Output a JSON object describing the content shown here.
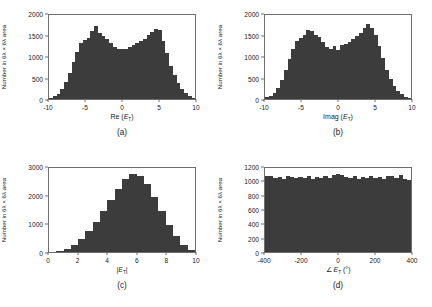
{
  "figure": {
    "bar_color": "#3c3c3c",
    "axis_color": "#6e6e6e",
    "background": "#ffffff"
  },
  "panels": [
    {
      "caption": "(a)",
      "ylabel": "Number in 6λ × 6λ area",
      "xlabel_html": "Re (<i>E</i><sub>T</sub>)",
      "xlabel": "Re (E_T)",
      "yticks": [
        "0",
        "500",
        "1000",
        "1500",
        "2000"
      ],
      "xticks": [
        "-10",
        "-5",
        "0",
        "5",
        "10"
      ]
    },
    {
      "caption": "(b)",
      "ylabel": "Number in 6λ × 6λ area",
      "xlabel_html": "Imag (<i>E</i><sub>T</sub>)",
      "xlabel": "Imag (E_T)",
      "yticks": [
        "0",
        "500",
        "1000",
        "1500",
        "2000"
      ],
      "xticks": [
        "-10",
        "-5",
        "0",
        "5",
        "10"
      ]
    },
    {
      "caption": "(c)",
      "ylabel": "Number in 6λ × 6λ area",
      "xlabel_html": "|<i>E</i><sub>T</sub>|",
      "xlabel": "|E_T|",
      "yticks": [
        "0",
        "1000",
        "2000",
        "3000"
      ],
      "xticks": [
        "0",
        "2",
        "4",
        "6",
        "8",
        "10"
      ]
    },
    {
      "caption": "(d)",
      "ylabel": "Number in 6λ × 6λ area",
      "xlabel_html": "∠ <i>E</i><sub>T</sub> (°)",
      "xlabel": "∠E_T (°)",
      "yticks": [
        "0",
        "200",
        "400",
        "600",
        "800",
        "1000",
        "1200"
      ],
      "xticks": [
        "-400",
        "-200",
        "0",
        "200",
        "400"
      ]
    }
  ],
  "chart_data": [
    {
      "type": "bar",
      "title": "",
      "subplot": "(a)",
      "xlabel": "Re (E_T)",
      "ylabel": "Number in 6λ × 6λ area",
      "xlim": [
        -10,
        10
      ],
      "ylim": [
        0,
        2000
      ],
      "grid": false,
      "bin_centers": [
        -9.5,
        -9.0,
        -8.5,
        -8.0,
        -7.5,
        -7.0,
        -6.5,
        -6.0,
        -5.5,
        -5.0,
        -4.5,
        -4.0,
        -3.5,
        -3.0,
        -2.5,
        -2.0,
        -1.5,
        -1.0,
        -0.5,
        0.0,
        0.5,
        1.0,
        1.5,
        2.0,
        2.5,
        3.0,
        3.5,
        4.0,
        4.5,
        5.0,
        5.5,
        6.0,
        6.5,
        7.0,
        7.5,
        8.0,
        8.5,
        9.0,
        9.5
      ],
      "values": [
        30,
        60,
        120,
        230,
        400,
        620,
        870,
        1130,
        1330,
        1400,
        1450,
        1620,
        1750,
        1580,
        1490,
        1420,
        1330,
        1250,
        1200,
        1180,
        1200,
        1230,
        1280,
        1330,
        1380,
        1420,
        1520,
        1600,
        1670,
        1640,
        1380,
        1100,
        790,
        560,
        390,
        250,
        140,
        70,
        30
      ]
    },
    {
      "type": "bar",
      "title": "",
      "subplot": "(b)",
      "xlabel": "Imag (E_T)",
      "ylabel": "Number in 6λ × 6λ area",
      "xlim": [
        -10,
        10
      ],
      "ylim": [
        0,
        2000
      ],
      "grid": false,
      "bin_centers": [
        -9.5,
        -9.0,
        -8.5,
        -8.0,
        -7.5,
        -7.0,
        -6.5,
        -6.0,
        -5.5,
        -5.0,
        -4.5,
        -4.0,
        -3.5,
        -3.0,
        -2.5,
        -2.0,
        -1.5,
        -1.0,
        -0.5,
        0.0,
        0.5,
        1.0,
        1.5,
        2.0,
        2.5,
        3.0,
        3.5,
        4.0,
        4.5,
        5.0,
        5.5,
        6.0,
        6.5,
        7.0,
        7.5,
        8.0,
        8.5,
        9.0,
        9.5
      ],
      "values": [
        40,
        80,
        150,
        270,
        450,
        700,
        960,
        1200,
        1380,
        1450,
        1530,
        1650,
        1610,
        1530,
        1470,
        1360,
        1240,
        1180,
        1270,
        1170,
        1290,
        1300,
        1360,
        1440,
        1500,
        1560,
        1680,
        1790,
        1700,
        1520,
        1260,
        980,
        690,
        480,
        320,
        200,
        110,
        55,
        25
      ]
    },
    {
      "type": "bar",
      "title": "",
      "subplot": "(c)",
      "xlabel": "|E_T|",
      "ylabel": "Number in 6λ × 6λ area",
      "xlim": [
        0,
        10
      ],
      "ylim": [
        0,
        3000
      ],
      "grid": false,
      "bin_centers": [
        0.25,
        0.75,
        1.25,
        1.75,
        2.25,
        2.75,
        3.25,
        3.75,
        4.25,
        4.75,
        5.25,
        5.75,
        6.25,
        6.75,
        7.25,
        7.75,
        8.25,
        8.75,
        9.25,
        9.75
      ],
      "values": [
        10,
        40,
        110,
        260,
        480,
        760,
        1080,
        1450,
        1850,
        2260,
        2620,
        2800,
        2700,
        2420,
        1980,
        1480,
        980,
        560,
        250,
        80
      ]
    },
    {
      "type": "bar",
      "title": "",
      "subplot": "(d)",
      "xlabel": "∠E_T (°)",
      "ylabel": "Number in 6λ × 6λ area",
      "xlim": [
        -400,
        400
      ],
      "ylim": [
        0,
        1200
      ],
      "grid": false,
      "bin_centers": [
        -340,
        -320,
        -300,
        -280,
        -260,
        -240,
        -220,
        -200,
        -180,
        -160,
        -140,
        -120,
        -100,
        -80,
        -60,
        -40,
        -20,
        0,
        20,
        40,
        60,
        80,
        100,
        120,
        140,
        160,
        180,
        200,
        220,
        240,
        260,
        280,
        300,
        320,
        340
      ],
      "values": [
        1080,
        1090,
        1060,
        1075,
        1050,
        1085,
        1065,
        1055,
        1070,
        1060,
        1085,
        1050,
        1070,
        1060,
        1080,
        1055,
        1100,
        1120,
        1105,
        1075,
        1060,
        1085,
        1050,
        1070,
        1055,
        1085,
        1060,
        1070,
        1045,
        1080,
        1090,
        1060,
        1095,
        1050,
        1035
      ]
    }
  ]
}
